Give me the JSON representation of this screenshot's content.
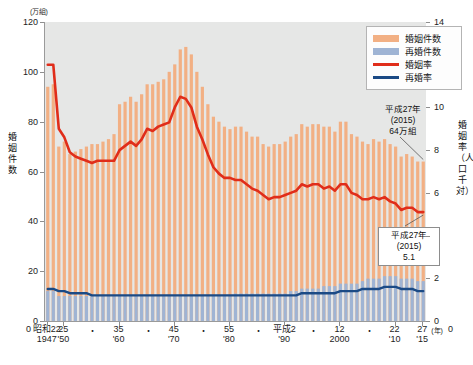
{
  "chart_data": {
    "type": "bar",
    "title": "",
    "xlabel": "年",
    "ylabel": "婚姻件数",
    "y2label": "婚姻率（人口千対）",
    "unit_left": "(万組)",
    "unit_right": "",
    "ylim": [
      0,
      120
    ],
    "y2lim": [
      0,
      14
    ],
    "yticks": [
      0,
      20,
      40,
      60,
      80,
      100,
      120
    ],
    "y2ticks": [
      0,
      2,
      4,
      6,
      8,
      10,
      12,
      14
    ],
    "grid": false,
    "legend_position": "top-right",
    "x": [
      1947,
      1948,
      1949,
      1950,
      1951,
      1952,
      1953,
      1954,
      1955,
      1956,
      1957,
      1958,
      1959,
      1960,
      1961,
      1962,
      1963,
      1964,
      1965,
      1966,
      1967,
      1968,
      1969,
      1970,
      1971,
      1972,
      1973,
      1974,
      1975,
      1976,
      1977,
      1978,
      1979,
      1980,
      1981,
      1982,
      1983,
      1984,
      1985,
      1986,
      1987,
      1988,
      1989,
      1990,
      1991,
      1992,
      1993,
      1994,
      1995,
      1996,
      1997,
      1998,
      1999,
      2000,
      2001,
      2002,
      2003,
      2004,
      2005,
      2006,
      2007,
      2008,
      2009,
      2010,
      2011,
      2012,
      2013,
      2014,
      2015
    ],
    "series": [
      {
        "name": "婚姻件数",
        "type": "bar",
        "axis": "left",
        "color": "#f2b084",
        "values": [
          94,
          95,
          70,
          72,
          67,
          68,
          69,
          70,
          71,
          71,
          72,
          73,
          75,
          87,
          88,
          90,
          88,
          91,
          95,
          95,
          96,
          97,
          100,
          103,
          109,
          110,
          107,
          100,
          94,
          87,
          82,
          80,
          78,
          77,
          78,
          78,
          76,
          74,
          74,
          71,
          70,
          71,
          71,
          72,
          74,
          75,
          79,
          78,
          79,
          79,
          78,
          78,
          76,
          80,
          80,
          75,
          74,
          72,
          71,
          73,
          72,
          73,
          71,
          70,
          66,
          67,
          66,
          64,
          64
        ]
      },
      {
        "name": "再婚件数",
        "type": "bar",
        "axis": "left",
        "color": "#9fb4d4",
        "values": [
          12,
          12,
          10,
          10,
          10,
          10,
          10,
          10,
          10,
          10,
          10,
          10,
          10,
          10,
          10,
          10,
          10,
          10,
          10,
          10,
          10,
          10,
          10,
          10,
          10,
          10,
          10,
          10,
          10,
          10,
          10,
          10,
          10,
          10,
          11,
          11,
          11,
          11,
          11,
          11,
          11,
          11,
          11,
          11,
          12,
          12,
          13,
          13,
          13,
          13,
          14,
          14,
          14,
          15,
          15,
          15,
          15,
          16,
          17,
          17,
          17,
          18,
          18,
          18,
          17,
          17,
          17,
          16,
          16
        ]
      },
      {
        "name": "婚姻率",
        "type": "line",
        "axis": "right",
        "color": "#e02d1a",
        "values": [
          12.0,
          12.0,
          9.0,
          8.6,
          7.9,
          7.7,
          7.6,
          7.5,
          7.4,
          7.5,
          7.5,
          7.5,
          7.5,
          8.0,
          8.2,
          8.4,
          8.2,
          8.5,
          9.0,
          8.9,
          9.1,
          9.2,
          9.3,
          10.0,
          10.5,
          10.4,
          10.0,
          9.1,
          8.5,
          7.8,
          7.2,
          6.9,
          6.7,
          6.7,
          6.6,
          6.6,
          6.4,
          6.2,
          6.1,
          5.9,
          5.7,
          5.8,
          5.8,
          5.9,
          6.0,
          6.1,
          6.4,
          6.3,
          6.4,
          6.4,
          6.2,
          6.3,
          6.1,
          6.4,
          6.4,
          6.0,
          5.9,
          5.7,
          5.7,
          5.8,
          5.7,
          5.8,
          5.6,
          5.5,
          5.2,
          5.3,
          5.3,
          5.1,
          5.1
        ]
      },
      {
        "name": "再婚率",
        "type": "line",
        "axis": "right",
        "color": "#1b4a85",
        "values": [
          1.5,
          1.5,
          1.4,
          1.4,
          1.3,
          1.3,
          1.3,
          1.3,
          1.2,
          1.2,
          1.2,
          1.2,
          1.2,
          1.2,
          1.2,
          1.2,
          1.2,
          1.2,
          1.2,
          1.2,
          1.2,
          1.2,
          1.2,
          1.2,
          1.2,
          1.2,
          1.2,
          1.2,
          1.2,
          1.2,
          1.2,
          1.2,
          1.2,
          1.2,
          1.2,
          1.2,
          1.2,
          1.2,
          1.2,
          1.2,
          1.2,
          1.2,
          1.2,
          1.2,
          1.2,
          1.2,
          1.3,
          1.3,
          1.3,
          1.3,
          1.3,
          1.3,
          1.3,
          1.4,
          1.4,
          1.4,
          1.4,
          1.5,
          1.5,
          1.5,
          1.5,
          1.6,
          1.6,
          1.6,
          1.5,
          1.5,
          1.5,
          1.4,
          1.4
        ]
      }
    ],
    "xtick_labels": [
      {
        "x": 1947,
        "top": "昭和22",
        "bottom": "1947"
      },
      {
        "x": 1950,
        "top": "25",
        "bottom": "'50"
      },
      {
        "x": 1955,
        "top": "・",
        "bottom": ""
      },
      {
        "x": 1960,
        "top": "35",
        "bottom": "'60"
      },
      {
        "x": 1965,
        "top": "・",
        "bottom": ""
      },
      {
        "x": 1970,
        "top": "45",
        "bottom": "'70"
      },
      {
        "x": 1975,
        "top": "・",
        "bottom": ""
      },
      {
        "x": 1980,
        "top": "55",
        "bottom": "'80"
      },
      {
        "x": 1985,
        "top": "・",
        "bottom": ""
      },
      {
        "x": 1990,
        "top": "平成2",
        "bottom": "'90"
      },
      {
        "x": 1995,
        "top": "・",
        "bottom": ""
      },
      {
        "x": 2000,
        "top": "12",
        "bottom": "2000"
      },
      {
        "x": 2005,
        "top": "・",
        "bottom": ""
      },
      {
        "x": 2010,
        "top": "22",
        "bottom": "'10"
      },
      {
        "x": 2015,
        "top": "27",
        "bottom": "'15"
      }
    ],
    "annotations": [
      {
        "name": "marriage-count-2015",
        "lines": [
          "平成27年",
          "(2015)",
          "64万組"
        ],
        "target_x": 2015,
        "target_series": "婚姻件数"
      },
      {
        "name": "marriage-rate-2015",
        "lines": [
          "平成27年",
          "(2015)",
          "5.1"
        ],
        "target_x": 2015,
        "target_series": "婚姻率"
      }
    ]
  },
  "axis": {
    "unit_left": "(万組)",
    "title_left": "婚姻件数",
    "title_right": "婚姻率（人口千対）",
    "x_unit": "(年)",
    "zero_left": "0",
    "zero_right": "0"
  },
  "legend": {
    "items": [
      {
        "label": "婚姻件数",
        "color": "#f2b084",
        "style": "bar"
      },
      {
        "label": "再婚件数",
        "color": "#9fb4d4",
        "style": "bar"
      },
      {
        "label": "婚姻率",
        "color": "#e02d1a",
        "style": "line"
      },
      {
        "label": "再婚率",
        "color": "#1b4a85",
        "style": "line"
      }
    ]
  },
  "colors": {
    "marriage_bar": "#f2b084",
    "remarriage_bar": "#9fb4d4",
    "marriage_rate_line": "#e02d1a",
    "remarriage_rate_line": "#1b4a85",
    "plot_background": "#e6e7e6",
    "axis": "#9a9a9a"
  }
}
